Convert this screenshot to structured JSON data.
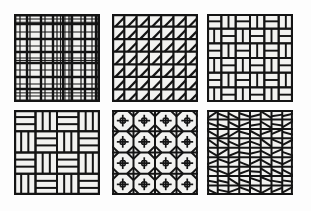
{
  "figure": {
    "name": "tiling-pattern-grid-figure",
    "width": 311,
    "height": 211,
    "background_color": "#fdfdfd",
    "line_color": "#141414",
    "tile_fill_color": "#f2f2f0",
    "layout": {
      "rows": 2,
      "columns": 6,
      "panel_count": 6
    }
  },
  "panels": [
    {
      "id": "panel-1",
      "name": "plaid-grid-pattern",
      "label": "",
      "pattern_type": "irregular-plaid-grid",
      "x": 14,
      "y": 14,
      "width": 86,
      "height": 88,
      "description": "Irregularly spaced orthogonal horizontal and vertical lines forming a plaid lattice",
      "v_lines": [
        0,
        6,
        13,
        16,
        27,
        31,
        39,
        43,
        49,
        55,
        58,
        67,
        71,
        78,
        82,
        86
      ],
      "h_lines": [
        0,
        5,
        10,
        18,
        25,
        32,
        38,
        44,
        49,
        56,
        63,
        70,
        75,
        82,
        88
      ],
      "stroke_widths": [
        2.4,
        1.2,
        2.4,
        1.2,
        2.4,
        1.2,
        2.4,
        1.2,
        2.4,
        1.2,
        2.4,
        1.2,
        2.4,
        1.2,
        2.4,
        2.4
      ]
    },
    {
      "id": "panel-2",
      "name": "diagonal-chamfer-grid-pattern",
      "label": "",
      "pattern_type": "grid-with-anti-diagonals",
      "x": 112,
      "y": 14,
      "width": 86,
      "height": 88,
      "description": "Regular square grid where every cell contains a single diagonal from lower-left to upper-right",
      "cols": 7,
      "rows": 7,
      "diagonal_direction": "bottom-left-to-top-right",
      "diagonal_inset": 0.28
    },
    {
      "id": "panel-3",
      "name": "basketweave-small-pattern",
      "label": "",
      "pattern_type": "basketweave",
      "x": 207,
      "y": 14,
      "width": 86,
      "height": 88,
      "description": "Basketweave of short bars alternating horizontal and vertical orientation, 2:1 brick ratio",
      "cols": 12,
      "rows": 12,
      "brick_ratio": 2
    },
    {
      "id": "panel-4",
      "name": "parquet-weave-pattern",
      "label": "",
      "pattern_type": "parquet-basketweave",
      "x": 14,
      "y": 110,
      "width": 86,
      "height": 85,
      "description": "Interlocking parquet weave of elongated 3:1 bricks rotating around each block",
      "cols": 12,
      "rows": 12,
      "brick_ratio": 3
    },
    {
      "id": "panel-5",
      "name": "octagon-square-pattern",
      "label": "",
      "pattern_type": "truncated-square-octagon",
      "x": 112,
      "y": 110,
      "width": 86,
      "height": 85,
      "description": "Octagons formed by chamfering all four corners of each grid cell, with small squares at the intersections and a cross inside each octagon",
      "cols": 4,
      "rows": 4,
      "chamfer": 0.3
    },
    {
      "id": "panel-6",
      "name": "random-diagonal-grid-pattern",
      "label": "",
      "pattern_type": "grid-with-random-diagonals",
      "x": 207,
      "y": 110,
      "width": 86,
      "height": 85,
      "description": "Regular grid where each cell holds a randomly oriented slanted line, producing a disordered texture",
      "cols": 8,
      "rows": 9,
      "diagonal_direction": "random"
    }
  ]
}
